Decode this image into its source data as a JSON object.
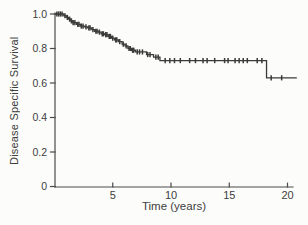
{
  "figure": {
    "background": "#fcfcfa",
    "ink_color": "#3a3a3a",
    "axis_color": "#4a4a4a"
  },
  "chart_data": {
    "type": "line",
    "subtype": "kaplan-meier-step-function",
    "title": "",
    "xlabel": "Time (years)",
    "ylabel": "Disease Specific Survival",
    "xlim": [
      0,
      20
    ],
    "ylim": [
      0,
      1.0
    ],
    "grid": false,
    "legend": false,
    "x_ticks": [
      {
        "value": 5,
        "label": "5"
      },
      {
        "value": 10,
        "label": "10"
      },
      {
        "value": 15,
        "label": "15"
      },
      {
        "value": 20,
        "label": "20"
      }
    ],
    "y_ticks": [
      {
        "value": 1.0,
        "label": "1.0"
      },
      {
        "value": 0.8,
        "label": "0.8"
      },
      {
        "value": 0.6,
        "label": "0.6"
      },
      {
        "value": 0.4,
        "label": "0.4"
      },
      {
        "value": 0.2,
        "label": "0.2"
      },
      {
        "value": 0.0,
        "label": "0"
      }
    ],
    "readings": {
      "survival_at_5y": 0.85,
      "survival_at_10y": 0.73,
      "plateau_9_to_18y": 0.73,
      "final_after_drop": 0.63,
      "drop_year": 18.2,
      "curve_end_year": 20.8
    },
    "series": [
      {
        "name": "Disease Specific Survival",
        "color": "#3a3a3a",
        "end_time": 20.8,
        "steps": [
          [
            0.0,
            1.0
          ],
          [
            0.8,
            0.99
          ],
          [
            1.0,
            0.98
          ],
          [
            1.2,
            0.97
          ],
          [
            1.4,
            0.96
          ],
          [
            1.55,
            0.95
          ],
          [
            1.9,
            0.94
          ],
          [
            2.25,
            0.93
          ],
          [
            2.55,
            0.925
          ],
          [
            2.85,
            0.92
          ],
          [
            3.2,
            0.91
          ],
          [
            3.45,
            0.9
          ],
          [
            3.75,
            0.895
          ],
          [
            4.0,
            0.885
          ],
          [
            4.3,
            0.88
          ],
          [
            4.6,
            0.87
          ],
          [
            4.9,
            0.86
          ],
          [
            5.15,
            0.85
          ],
          [
            5.5,
            0.84
          ],
          [
            5.8,
            0.825
          ],
          [
            6.05,
            0.815
          ],
          [
            6.3,
            0.8
          ],
          [
            6.6,
            0.79
          ],
          [
            6.95,
            0.78
          ],
          [
            7.9,
            0.765
          ],
          [
            8.5,
            0.75
          ],
          [
            9.05,
            0.73
          ],
          [
            18.2,
            0.63
          ]
        ],
        "censor_marks": [
          [
            0.2,
            1.0
          ],
          [
            0.35,
            1.0
          ],
          [
            0.5,
            1.0
          ],
          [
            0.65,
            1.0
          ],
          [
            0.9,
            0.99
          ],
          [
            1.1,
            0.98
          ],
          [
            1.3,
            0.97
          ],
          [
            1.45,
            0.96
          ],
          [
            1.6,
            0.95
          ],
          [
            1.75,
            0.95
          ],
          [
            2.0,
            0.94
          ],
          [
            2.1,
            0.94
          ],
          [
            2.3,
            0.93
          ],
          [
            2.45,
            0.93
          ],
          [
            2.7,
            0.925
          ],
          [
            2.95,
            0.92
          ],
          [
            3.05,
            0.92
          ],
          [
            3.3,
            0.91
          ],
          [
            3.55,
            0.9
          ],
          [
            3.65,
            0.9
          ],
          [
            3.85,
            0.895
          ],
          [
            4.1,
            0.885
          ],
          [
            4.2,
            0.885
          ],
          [
            4.4,
            0.88
          ],
          [
            4.5,
            0.88
          ],
          [
            4.7,
            0.87
          ],
          [
            4.8,
            0.87
          ],
          [
            5.0,
            0.86
          ],
          [
            5.25,
            0.85
          ],
          [
            5.35,
            0.85
          ],
          [
            5.6,
            0.84
          ],
          [
            5.9,
            0.825
          ],
          [
            6.15,
            0.815
          ],
          [
            6.4,
            0.8
          ],
          [
            6.5,
            0.8
          ],
          [
            6.7,
            0.79
          ],
          [
            6.8,
            0.79
          ],
          [
            7.1,
            0.78
          ],
          [
            7.3,
            0.78
          ],
          [
            7.55,
            0.78
          ],
          [
            8.0,
            0.765
          ],
          [
            8.2,
            0.765
          ],
          [
            8.7,
            0.75
          ],
          [
            8.9,
            0.75
          ],
          [
            9.5,
            0.73
          ],
          [
            9.9,
            0.73
          ],
          [
            10.3,
            0.73
          ],
          [
            10.8,
            0.73
          ],
          [
            11.6,
            0.73
          ],
          [
            12.1,
            0.73
          ],
          [
            12.75,
            0.73
          ],
          [
            13.1,
            0.73
          ],
          [
            13.75,
            0.73
          ],
          [
            14.6,
            0.73
          ],
          [
            14.9,
            0.73
          ],
          [
            15.5,
            0.73
          ],
          [
            15.85,
            0.73
          ],
          [
            16.2,
            0.73
          ],
          [
            16.55,
            0.73
          ],
          [
            17.4,
            0.73
          ],
          [
            17.8,
            0.73
          ],
          [
            18.6,
            0.63
          ],
          [
            19.5,
            0.63
          ]
        ]
      }
    ]
  }
}
